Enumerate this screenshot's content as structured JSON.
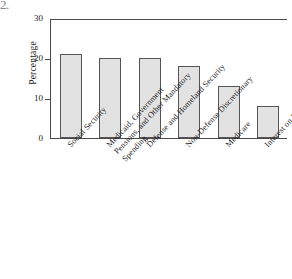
{
  "figure": {
    "corner_mark": "2."
  },
  "chart_data": {
    "type": "bar",
    "title": "",
    "xlabel": "",
    "ylabel": "Percentage",
    "ylim": [
      0,
      30
    ],
    "yticks": [
      0,
      10,
      20,
      30
    ],
    "ytick_labels": [
      "0",
      "10",
      "20",
      "30"
    ],
    "grid": false,
    "legend": null,
    "categories": [
      "Social Security",
      "Medicaid, Government Pensions, and Other Mandatory Spending",
      "Defense and Homeland Security",
      "Non-Defense Discretionary",
      "Medicare",
      "Interest on Debt"
    ],
    "category_lines": [
      [
        "Social Security"
      ],
      [
        "Medicaid, Government",
        "Pensions, and Other Mandatory",
        "Spending"
      ],
      [
        "Defense and Homeland Security"
      ],
      [
        "Non-Defense Discretionary"
      ],
      [
        "Medicare"
      ],
      [
        "Interest on Debt"
      ]
    ],
    "values": [
      21,
      20,
      20,
      18,
      13,
      8
    ],
    "bar_fill": "#e2e2e2",
    "bar_edge": "#555555",
    "axis_color": "#4a4a4a"
  }
}
